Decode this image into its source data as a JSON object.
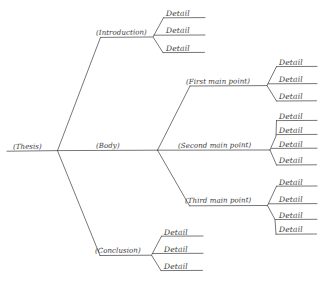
{
  "diagram": {
    "type": "tree-outline",
    "style": "hand-drawn",
    "ink_color": "#3a3a3c",
    "background_color": "#ffffff",
    "root": {
      "id": "thesis",
      "label": "(Thesis)"
    },
    "level1": [
      {
        "id": "introduction",
        "label": "(Introduction)"
      },
      {
        "id": "body",
        "label": "(Body)"
      },
      {
        "id": "conclusion",
        "label": "(Conclusion)"
      }
    ],
    "level2": [
      {
        "id": "first-main-point",
        "label": "(First main point)"
      },
      {
        "id": "second-main-point",
        "label": "(Second main point)"
      },
      {
        "id": "third-main-point",
        "label": "(Third main point)"
      }
    ],
    "details": {
      "introduction": [
        "Detail",
        "Detail",
        "Detail"
      ],
      "first_main_point": [
        "Detail",
        "Detail",
        "Detail"
      ],
      "second_main_point": [
        "Detail",
        "Detail",
        "Detail",
        "Detail"
      ],
      "third_main_point": [
        "Detail",
        "Detail",
        "Detail",
        "Detail"
      ],
      "conclusion": [
        "Detail",
        "Detail",
        "Detail"
      ]
    }
  }
}
